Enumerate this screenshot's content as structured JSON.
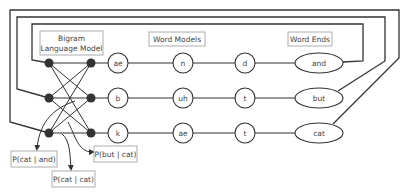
{
  "diagram": {
    "labels": {
      "bigram_line1": "Bigram",
      "bigram_line2": "Language Model",
      "word_models": "Word Models",
      "word_ends": "Word Ends"
    },
    "phone_rows": [
      {
        "phones": [
          "ae",
          "n",
          "d"
        ],
        "word_end": "and"
      },
      {
        "phones": [
          "b",
          "uh",
          "t"
        ],
        "word_end": "but"
      },
      {
        "phones": [
          "k",
          "ae",
          "t"
        ],
        "word_end": "cat"
      }
    ],
    "probabilities": [
      {
        "label": "P(cat | and)"
      },
      {
        "label": "P(but | cat)"
      },
      {
        "label": "P(cat | cat)"
      }
    ],
    "colors": {
      "line": "#333333",
      "node": "#333333",
      "box_border": "#999999",
      "text": "#444444"
    }
  }
}
